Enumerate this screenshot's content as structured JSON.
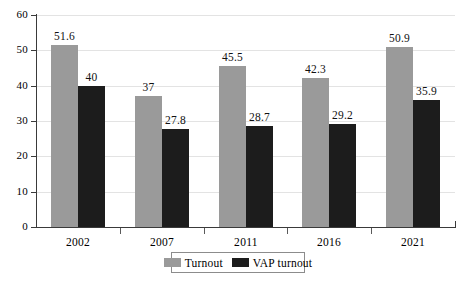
{
  "chart_data": {
    "type": "bar",
    "title": "",
    "subtitle": "",
    "xlabel": "",
    "ylabel": "",
    "categories": [
      "2002",
      "2007",
      "2011",
      "2016",
      "2021"
    ],
    "series": [
      {
        "name": "Turnout",
        "color": "#9a9a9a",
        "values": [
          51.6,
          37,
          45.5,
          42.3,
          50.9
        ],
        "labels": [
          "51.6",
          "37",
          "45.5",
          "42.3",
          "50.9"
        ]
      },
      {
        "name": "VAP turnout",
        "color": "#1c1c1c",
        "values": [
          40,
          27.8,
          28.7,
          29.2,
          35.9
        ],
        "labels": [
          "40",
          "27.8",
          "28.7",
          "29.2",
          "35.9"
        ]
      }
    ],
    "ylim": [
      0,
      60
    ],
    "yticks": [
      0,
      10,
      20,
      30,
      40,
      50,
      60
    ],
    "ytick_labels": [
      "0",
      "10",
      "20",
      "30",
      "40",
      "50",
      "60"
    ],
    "grid": true,
    "grid_axis": "y",
    "legend_position": "bottom-center",
    "legend_entries": [
      "Turnout",
      "VAP turnout"
    ],
    "data_labels_shown": true
  },
  "axes": {
    "y_axis_color": "#3a3a3a",
    "x_axis_color": "#3a3a3a",
    "gridline_color": "#e3e3e3"
  }
}
